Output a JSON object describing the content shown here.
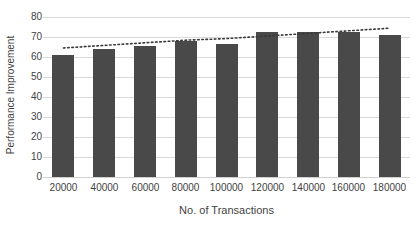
{
  "chart_data": {
    "type": "bar",
    "title": "",
    "xlabel": "No. of Transactions",
    "ylabel": "Performance Improvement",
    "categories": [
      "20000",
      "40000",
      "60000",
      "80000",
      "100000",
      "120000",
      "140000",
      "160000",
      "180000"
    ],
    "values": [
      61,
      64,
      65.5,
      68,
      66.5,
      72.5,
      72.5,
      72.5,
      71
    ],
    "series": [
      {
        "name": "Performance Improvement",
        "type": "bar",
        "values": [
          61,
          64,
          65.5,
          68,
          66.5,
          72.5,
          72.5,
          72.5,
          71
        ]
      },
      {
        "name": "Trendline",
        "type": "line",
        "style": "dotted",
        "values": [
          64.5,
          65.8,
          67.1,
          68.4,
          69.2,
          70.5,
          71.8,
          73.1,
          74.4
        ]
      }
    ],
    "ylim": [
      0,
      80
    ],
    "yticks": [
      0,
      10,
      20,
      30,
      40,
      50,
      60,
      70,
      80
    ],
    "ytick_labels": [
      "0",
      "10",
      "20",
      "30",
      "40",
      "50",
      "60",
      "70",
      "80"
    ],
    "grid": true,
    "grid_axis": "y",
    "legend": false,
    "legend_position": "none",
    "bar_color": "#494949",
    "grid_color": "#d9d9d9",
    "trendline_color": "#3a3a3a",
    "text_color": "#3f3f3f",
    "background": "#ffffff"
  }
}
